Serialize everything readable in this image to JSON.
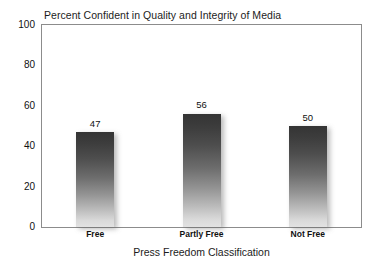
{
  "chart_data": {
    "type": "bar",
    "title": "Percent Confident in Quality and Integrity of Media",
    "xlabel": "Press Freedom Classification",
    "ylabel": "",
    "categories": [
      "Free",
      "Partly Free",
      "Not Free"
    ],
    "values": [
      47,
      56,
      50
    ],
    "value_labels": [
      "47",
      "56",
      "50"
    ],
    "ylim": [
      0,
      100
    ],
    "yticks": [
      0,
      20,
      40,
      60,
      80,
      100
    ],
    "ytick_labels": [
      "0",
      "20",
      "40",
      "60",
      "80",
      "100"
    ],
    "grid": false,
    "legend": false,
    "legend_position": "none",
    "bar_fill_top_color": "#343434",
    "bar_fill_bottom_color": "#e2e2e2",
    "frame_color": "#8c8c8c",
    "background_color": "#ffffff",
    "text_color": "#111111"
  }
}
